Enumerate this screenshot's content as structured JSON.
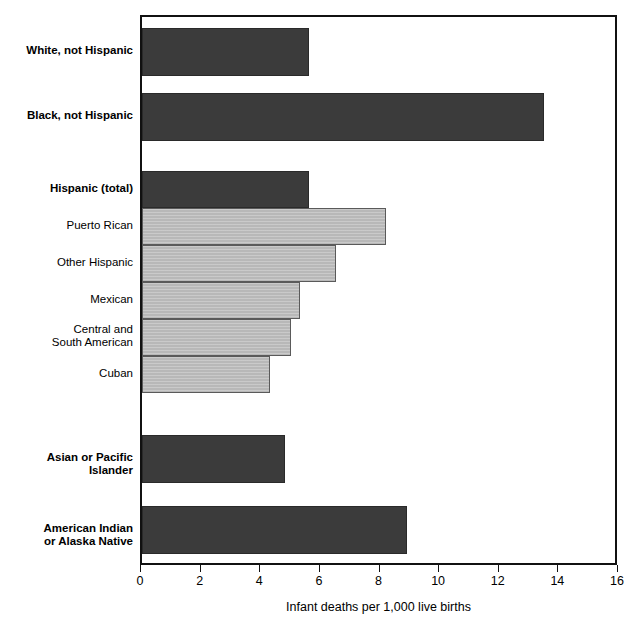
{
  "chart_data": {
    "type": "bar",
    "orientation": "horizontal",
    "title": "",
    "xlabel": "Infant deaths per 1,000 live births",
    "ylabel": "",
    "xlim": [
      0,
      16
    ],
    "xticks": [
      0,
      2,
      4,
      6,
      8,
      10,
      12,
      14,
      16
    ],
    "xtick_labels": [
      "0",
      "2",
      "4",
      "6",
      "8",
      "10",
      "12",
      "14",
      "16"
    ],
    "grid": false,
    "legend": "none",
    "categories": [
      "White, not Hispanic",
      "Black, not Hispanic",
      "Hispanic (total)",
      "Puerto Rican",
      "Other Hispanic",
      "Mexican",
      "Central and South American",
      "Cuban",
      "Asian or Pacific Islander",
      "American Indian or Alaska Native"
    ],
    "values": [
      5.6,
      13.5,
      5.6,
      8.2,
      6.5,
      5.3,
      5.0,
      4.3,
      4.8,
      8.9
    ],
    "bars": [
      {
        "label": "White, not Hispanic",
        "label_lines": "White, not Hispanic",
        "value": 5.6,
        "style": "dark",
        "emphasis": "major"
      },
      {
        "label": "Black, not Hispanic",
        "label_lines": "Black, not Hispanic",
        "value": 13.5,
        "style": "dark",
        "emphasis": "major"
      },
      {
        "label": "Hispanic (total)",
        "label_lines": "Hispanic (total)",
        "value": 5.6,
        "style": "dark",
        "emphasis": "major"
      },
      {
        "label": "Puerto Rican",
        "label_lines": "Puerto Rican",
        "value": 8.2,
        "style": "light",
        "emphasis": "sub"
      },
      {
        "label": "Other Hispanic",
        "label_lines": "Other Hispanic",
        "value": 6.5,
        "style": "light",
        "emphasis": "sub"
      },
      {
        "label": "Mexican",
        "label_lines": "Mexican",
        "value": 5.3,
        "style": "light",
        "emphasis": "sub"
      },
      {
        "label": "Central and South American",
        "label_lines": "Central and\nSouth American",
        "value": 5.0,
        "style": "light",
        "emphasis": "sub"
      },
      {
        "label": "Cuban",
        "label_lines": "Cuban",
        "value": 4.3,
        "style": "light",
        "emphasis": "sub"
      },
      {
        "label": "Asian or Pacific Islander",
        "label_lines": "Asian or Pacific\nIslander",
        "value": 4.8,
        "style": "dark",
        "emphasis": "major"
      },
      {
        "label": "American Indian or Alaska Native",
        "label_lines": "American Indian\nor Alaska Native",
        "value": 8.9,
        "style": "dark",
        "emphasis": "major"
      }
    ],
    "colors": {
      "dark_bar": "#3b3b3b",
      "light_bar": "#b8b8b8",
      "axis": "#111111",
      "background": "#ffffff",
      "text": "#000000"
    }
  }
}
